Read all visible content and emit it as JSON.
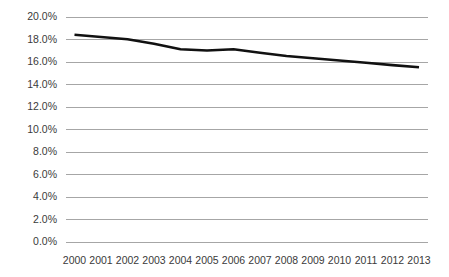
{
  "chart_data": {
    "type": "line",
    "title": "",
    "subtitle": "",
    "xlabel": "",
    "ylabel": "",
    "categories": [
      "2000",
      "2001",
      "2002",
      "2003",
      "2004",
      "2005",
      "2006",
      "2007",
      "2008",
      "2009",
      "2010",
      "2011",
      "2012",
      "2013"
    ],
    "x": [
      2000,
      2001,
      2002,
      2003,
      2004,
      2005,
      2006,
      2007,
      2008,
      2009,
      2010,
      2011,
      2012,
      2013
    ],
    "series": [
      {
        "name": "",
        "values": [
          18.4,
          18.2,
          18.0,
          17.6,
          17.1,
          17.0,
          17.1,
          16.8,
          16.5,
          16.3,
          16.1,
          15.9,
          15.7,
          15.5
        ],
        "color": "#111111"
      }
    ],
    "ylim": [
      0.0,
      20.0
    ],
    "ytick_values": [
      0.0,
      2.0,
      4.0,
      6.0,
      8.0,
      10.0,
      12.0,
      14.0,
      16.0,
      18.0,
      20.0
    ],
    "ytick_labels": [
      "0.0%",
      "2.0%",
      "4.0%",
      "6.0%",
      "8.0%",
      "10.0%",
      "12.0%",
      "14.0%",
      "16.0%",
      "18.0%",
      "20.0%"
    ],
    "xtick_labels": [
      "2000",
      "2001",
      "2002",
      "2003",
      "2004",
      "2005",
      "2006",
      "2007",
      "2008",
      "2009",
      "2010",
      "2011",
      "2012",
      "2013"
    ],
    "grid": {
      "horizontal": true,
      "vertical": false,
      "color": "#a6a6a6"
    },
    "legend": {
      "visible": false,
      "position": "none",
      "entries": []
    },
    "annotations": [],
    "axes": {
      "yaxis_line": false,
      "xaxis_line": false,
      "tick_marks": false
    },
    "colors": {
      "line": "#111111",
      "gridline": "#a6a6a6",
      "tick_text": "#3a3a3a",
      "background": "#ffffff"
    }
  }
}
